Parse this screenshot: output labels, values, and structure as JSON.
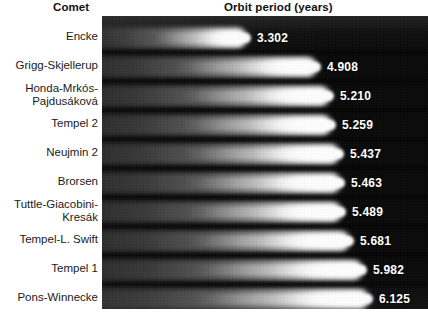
{
  "header": {
    "category_header": "Comet",
    "value_header": "Orbit period (years)"
  },
  "colors": {
    "panel_background": "#0a0a0a",
    "streak": "#ffffff",
    "page_background": "#ffffff",
    "label_text": "#1a1a1a",
    "value_text": "#ffffff"
  },
  "chart_data": {
    "type": "bar",
    "title": "Orbit period (years)",
    "xlabel": "Orbit period (years)",
    "ylabel": "Comet",
    "orientation": "horizontal",
    "grid": false,
    "legend": "none",
    "xlim": [
      0,
      6.6
    ],
    "categories": [
      "Encke",
      "Grigg-Skjellerup",
      "Honda-Mrkós-\nPajdusáková",
      "Tempel 2",
      "Neujmin 2",
      "Brorsen",
      "Tuttle-Giacobini-\nKresák",
      "Tempel-L. Swift",
      "Tempel 1",
      "Pons-Winnecke"
    ],
    "values": [
      3.302,
      4.908,
      5.21,
      5.259,
      5.437,
      5.463,
      5.489,
      5.681,
      5.982,
      6.125
    ],
    "value_labels": [
      "3.302",
      "4.908",
      "5.210",
      "5.259",
      "5.437",
      "5.463",
      "5.489",
      "5.681",
      "5.982",
      "6.125"
    ]
  }
}
